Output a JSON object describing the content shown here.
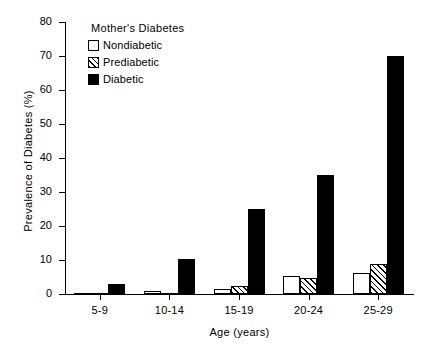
{
  "chart_data": {
    "type": "bar",
    "title": "",
    "xlabel": "Age  (years)",
    "ylabel": "Prevalence of Diabetes (%)",
    "categories": [
      "5-9",
      "10-14",
      "15-19",
      "20-24",
      "25-29"
    ],
    "ylim": [
      0,
      80
    ],
    "yticks": [
      0,
      10,
      20,
      30,
      40,
      50,
      60,
      70,
      80
    ],
    "ytick_labels": [
      "0",
      "10",
      "20",
      "30",
      "40",
      "50",
      "60",
      "70",
      "80"
    ],
    "grid": false,
    "legend_position": "upper-left-inside",
    "legend_title": "Mother's  Diabetes",
    "series": [
      {
        "name": "Nondiabetic",
        "fill": "white",
        "values": [
          0.3,
          0.8,
          1.5,
          5.3,
          6.2
        ]
      },
      {
        "name": "Prediabetic",
        "fill": "diagonal-hatch",
        "values": [
          0.2,
          0.4,
          2.4,
          4.7,
          8.7
        ]
      },
      {
        "name": "Diabetic",
        "fill": "black",
        "values": [
          3.0,
          10.2,
          25.0,
          35.0,
          70.0
        ]
      }
    ],
    "colors": {
      "axis": "#000000",
      "nondiabetic": "#ffffff",
      "prediabetic": "#ffffff",
      "diabetic": "#000000",
      "background": "#ffffff"
    }
  }
}
